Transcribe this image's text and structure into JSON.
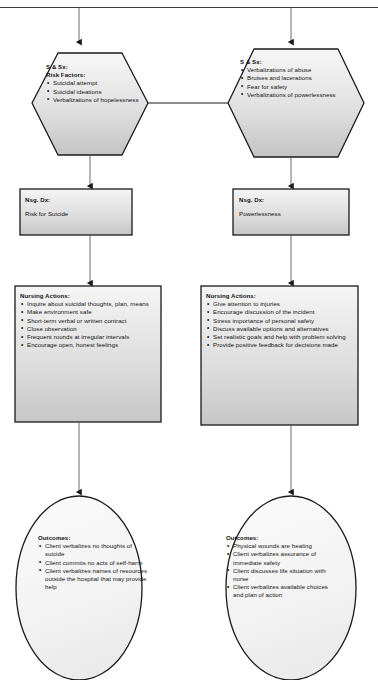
{
  "diagram": {
    "colors": {
      "stroke": "#1a1a1a",
      "fill_top": "#f4f4f4",
      "fill_bottom": "#c9c9c9",
      "box_fill_top": "#f2f2f2",
      "box_fill_bottom": "#cfcfcf",
      "oval_fill": "#f6f6f6",
      "arrow": "#555555",
      "text": "#111111"
    }
  },
  "branches": [
    {
      "id": "suicide",
      "assessment": {
        "heading": "S & Sx:",
        "subheading": "Risk Factors:",
        "items": [
          "Suicidal attempt",
          "Suicidal ideations",
          "Verbalizations of hopelessness"
        ]
      },
      "diagnosis": {
        "heading": "Nsg. Dx:",
        "value": "Risk for Suicide"
      },
      "actions": {
        "heading": "Nursing Actions:",
        "items": [
          "Inquire about suicidal thoughts, plan, means",
          "Make environment safe",
          "Short-term verbal or written contract",
          "Close observation",
          "Frequent rounds at irregular intervals",
          "Encourage open, honest feelings"
        ]
      },
      "outcomes": {
        "heading": "Outcomes:",
        "items": [
          "Client verbalizes no thoughts of suicide",
          "Client commits no acts of self-harm",
          "Client verbalizes names of resources outside the hospital that may provide help"
        ]
      }
    },
    {
      "id": "powerlessness",
      "assessment": {
        "heading": "S & Sx:",
        "subheading": "",
        "items": [
          "Verbalizations of abuse",
          "Bruises and lacerations",
          "Fear for safety",
          "Verbalizations of powerlessness"
        ]
      },
      "diagnosis": {
        "heading": "Nsg. Dx:",
        "value": "Powerlessness"
      },
      "actions": {
        "heading": "Nursing Actions:",
        "items": [
          "Give attention to injuries",
          "Encourage discussion of the incident",
          "Stress importance of personal safety",
          "Discuss available options and alternatives",
          "Set realistic goals and help with problem solving",
          "Provide positive feedback for decisions made"
        ]
      },
      "outcomes": {
        "heading": "Outcomes:",
        "items": [
          "Physical wounds are healing",
          "Client verbalizes assurance of immediate safety",
          "Client discusses life situation with nurse",
          "Client verbalizes available choices and plan of action"
        ]
      }
    }
  ]
}
